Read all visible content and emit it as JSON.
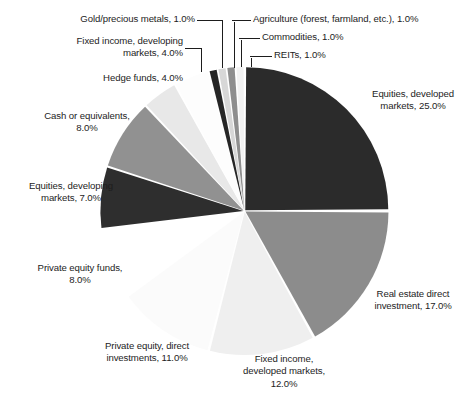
{
  "chart_data": {
    "type": "pie",
    "title": "",
    "subtitle": "",
    "xlabel": "",
    "ylabel": "",
    "legend_position": "none",
    "grid": false,
    "value_unit": "%",
    "total": 100.0,
    "start_angle_deg": 0,
    "direction": "clockwise",
    "categories": [
      "Equities, developed markets",
      "Real estate direct investment",
      "Fixed income, developed markets",
      "Private equity, direct investments",
      "Private equity funds",
      "Equities, developing markets",
      "Cash or equivalents",
      "Hedge funds",
      "Fixed income, developing markets",
      "Gold/precious metals",
      "Agriculture (forest, farmland, etc.)",
      "Commodities",
      "REITs"
    ],
    "values": [
      25.0,
      17.0,
      12.0,
      11.0,
      8.0,
      7.0,
      8.0,
      4.0,
      4.0,
      1.0,
      1.0,
      1.0,
      1.0
    ],
    "colors": [
      "#2b2b2b",
      "#8c8c8c",
      "#efefef",
      "#fbfbfb",
      "#ffffff",
      "#2e2e2e",
      "#919191",
      "#e8e8e8",
      "#fdfdfd",
      "#262626",
      "#d7d7d7",
      "#8e8e8e",
      "#f2f2f2"
    ]
  },
  "slices": [
    {
      "name": "equities-developed-markets",
      "label": "Equities, developed\nmarkets, 25.0%",
      "value": 25.0,
      "color": "#2b2b2b"
    },
    {
      "name": "real-estate-direct-investment",
      "label": "Real estate direct\ninvestment, 17.0%",
      "value": 17.0,
      "color": "#8c8c8c"
    },
    {
      "name": "fixed-income-developed-markets",
      "label": "Fixed income,\ndeveloped markets,\n12.0%",
      "value": 12.0,
      "color": "#efefef"
    },
    {
      "name": "private-equity-direct-investments",
      "label": "Private equity, direct\ninvestments, 11.0%",
      "value": 11.0,
      "color": "#fbfbfb"
    },
    {
      "name": "private-equity-funds",
      "label": "Private equity funds,\n8.0%",
      "value": 8.0,
      "color": "#ffffff"
    },
    {
      "name": "equities-developing-markets",
      "label": "Equities, developing\nmarkets, 7.0%",
      "value": 7.0,
      "color": "#2e2e2e"
    },
    {
      "name": "cash-or-equivalents",
      "label": "Cash or equivalents,\n8.0%",
      "value": 8.0,
      "color": "#919191"
    },
    {
      "name": "hedge-funds",
      "label": "Hedge funds, 4.0%",
      "value": 4.0,
      "color": "#e8e8e8"
    },
    {
      "name": "fixed-income-developing-markets",
      "label": "Fixed income, developing\nmarkets, 4.0%",
      "value": 4.0,
      "color": "#fdfdfd"
    },
    {
      "name": "gold-precious-metals",
      "label": "Gold/precious metals, 1.0%",
      "value": 1.0,
      "color": "#262626"
    },
    {
      "name": "agriculture",
      "label": "Agriculture (forest, farmland, etc.), 1.0%",
      "value": 1.0,
      "color": "#d7d7d7"
    },
    {
      "name": "commodities",
      "label": "Commodities, 1.0%",
      "value": 1.0,
      "color": "#8e8e8e"
    },
    {
      "name": "reits",
      "label": "REITs, 1.0%",
      "value": 1.0,
      "color": "#f2f2f2"
    }
  ]
}
